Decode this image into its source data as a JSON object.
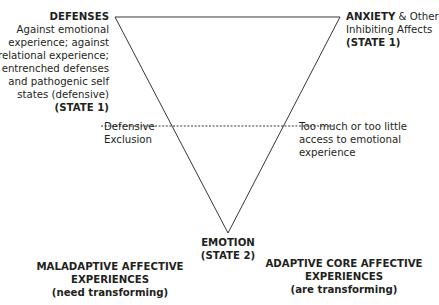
{
  "diagram": {
    "type": "inverted-triangle",
    "line_color": "#231f20",
    "text_color": "#231f20",
    "vertices": {
      "defenses": {
        "title": "DEFENSES",
        "lines": [
          "Against emotional",
          "experience; against",
          "relational experience;",
          "entrenched defenses",
          "and pathogenic self",
          "states (defensive)"
        ],
        "state": "(STATE 1)"
      },
      "anxiety": {
        "title": "ANXIETY",
        "title_suffix": " & Other",
        "line2": "Inhibiting Affects",
        "state": "(STATE 1)"
      },
      "emotion": {
        "title": "EMOTION",
        "state": "(STATE 2)"
      }
    },
    "dashed_line": {
      "left_label_lines": [
        "Defensive",
        "Exclusion"
      ],
      "right_label_lines": [
        "Too much or too little",
        "access to emotional",
        "experience"
      ]
    },
    "bottom_labels": {
      "maladaptive": {
        "lines": [
          "MALADAPTIVE AFFECTIVE",
          "EXPERIENCES"
        ],
        "note": "(need transforming)"
      },
      "adaptive": {
        "lines": [
          "ADAPTIVE CORE AFFECTIVE",
          "EXPERIENCES"
        ],
        "note": "(are transforming)"
      }
    }
  }
}
